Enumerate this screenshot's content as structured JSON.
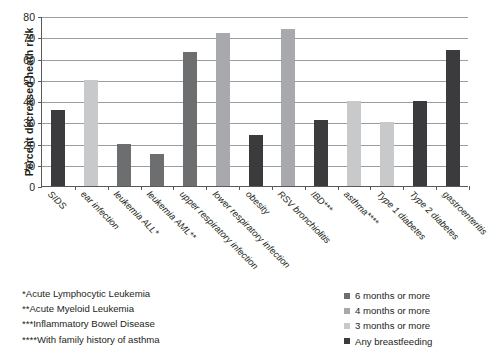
{
  "chart_data": {
    "type": "bar",
    "title": "",
    "xlabel": "",
    "ylabel": "Percent decreased heath risk",
    "ylim": [
      0,
      80
    ],
    "ytick_step": 10,
    "yticks": [
      "0",
      "10",
      "20",
      "30",
      "40",
      "50",
      "60",
      "70",
      "80"
    ],
    "grid": true,
    "legend_position": "bottom-right",
    "categories": [
      "SIDS",
      "ear infection",
      "leukemia ALL*",
      "leukemia AML**",
      "upper respiratory infection",
      "lower respiratory infection",
      "obesity",
      "RSV bronchiolitis",
      "IBD***",
      "asthma****",
      "Type 1 diabetes",
      "Type 2 diabetes",
      "gastroenteritis"
    ],
    "values": [
      36,
      50,
      20,
      15,
      63,
      72,
      24,
      74,
      31,
      40,
      30,
      40,
      64
    ],
    "series_of_bar": [
      "Any breastfeeding",
      "3 months or more",
      "6 months or more",
      "6 months or more",
      "6 months or more",
      "4 months or more",
      "Any breastfeeding",
      "4 months or more",
      "Any breastfeeding",
      "3 months or more",
      "3 months or more",
      "Any breastfeeding",
      "Any breastfeeding"
    ],
    "bar_colors": [
      "#3b3b3d",
      "#c8c9ca",
      "#6d6e70",
      "#6d6e70",
      "#6d6e70",
      "#a7a9ac",
      "#3b3b3d",
      "#a7a9ac",
      "#3b3b3d",
      "#c8c9ca",
      "#c8c9ca",
      "#3b3b3d",
      "#3b3b3d"
    ]
  },
  "legend": {
    "items": [
      {
        "label": "6 months or more",
        "color": "#6d6e70"
      },
      {
        "label": "4 months or more",
        "color": "#a7a9ac"
      },
      {
        "label": "3 months or more",
        "color": "#c8c9ca"
      },
      {
        "label": "Any breastfeeding",
        "color": "#3b3b3d"
      }
    ]
  },
  "footnotes": [
    "*Acute Lymphocytic Leukemia",
    "**Acute Myeloid Leukemia",
    "***Inflammatory Bowel Disease",
    "****With family history of asthma"
  ]
}
